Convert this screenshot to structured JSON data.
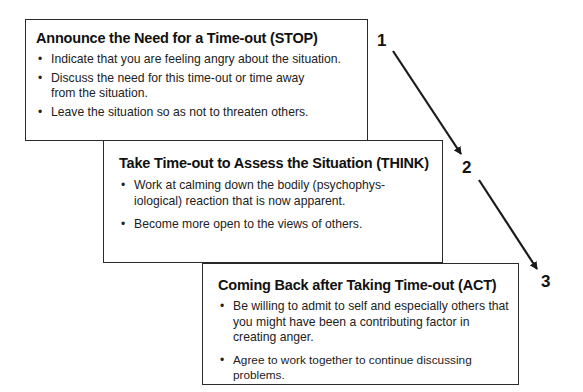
{
  "steps": [
    {
      "number": "1",
      "title": "Announce the Need for a Time-out (STOP)",
      "bullets": [
        "Indicate that you are feeling angry about the situation.",
        "Discuss the need for this time-out or time away from the situation.",
        "Leave the situation so as not to threaten others."
      ]
    },
    {
      "number": "2",
      "title": "Take Time-out to Assess the Situation (THINK)",
      "bullets": [
        "Work at calming down the bodily (psychophys-iological) reaction that is now apparent.",
        "Become more open to the views of others."
      ]
    },
    {
      "number": "3",
      "title": "Coming Back after Taking Time-out (ACT)",
      "bullets": [
        "Be willing to admit to self and especially others that you might have been a contributing factor in creating anger.",
        "Agree to work together to continue discussing problems."
      ]
    }
  ],
  "colors": {
    "line": "#1a1a1a",
    "background": "#ffffff"
  }
}
